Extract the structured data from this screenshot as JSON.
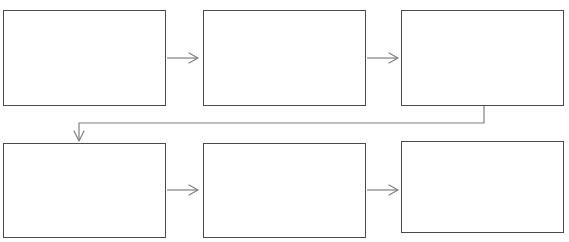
{
  "diagram": {
    "type": "flowchart",
    "title_cropped": "",
    "background_color": "#ffffff",
    "node_border_color": "#4a4a4a",
    "node_fill_color": "#ffffff",
    "connector_color": "#808080",
    "rows": 2,
    "columns": 3,
    "nodes": [
      {
        "id": "node-1",
        "label": "",
        "row": 1,
        "column": 1,
        "x": 3,
        "y": 10,
        "width": 163,
        "height": 96
      },
      {
        "id": "node-2",
        "label": "",
        "row": 1,
        "column": 2,
        "x": 203,
        "y": 10,
        "width": 163,
        "height": 96
      },
      {
        "id": "node-3",
        "label": "",
        "row": 1,
        "column": 3,
        "x": 401,
        "y": 10,
        "width": 163,
        "height": 96
      },
      {
        "id": "node-4",
        "label": "",
        "row": 2,
        "column": 1,
        "x": 3,
        "y": 143,
        "width": 163,
        "height": 95
      },
      {
        "id": "node-5",
        "label": "",
        "row": 2,
        "column": 2,
        "x": 203,
        "y": 143,
        "width": 163,
        "height": 95
      },
      {
        "id": "node-6",
        "label": "",
        "row": 2,
        "column": 3,
        "x": 401,
        "y": 141,
        "width": 163,
        "height": 92
      }
    ],
    "connectors": [
      {
        "id": "arrow-1-to-2",
        "from": "node-1",
        "to": "node-2",
        "label": "",
        "kind": "straight-right"
      },
      {
        "id": "arrow-2-to-3",
        "from": "node-2",
        "to": "node-3",
        "label": "",
        "kind": "straight-right"
      },
      {
        "id": "arrow-3-to-4",
        "from": "node-3",
        "to": "node-4",
        "label": "",
        "kind": "wrap-down-left"
      },
      {
        "id": "arrow-4-to-5",
        "from": "node-4",
        "to": "node-5",
        "label": "",
        "kind": "straight-right"
      },
      {
        "id": "arrow-5-to-6",
        "from": "node-5",
        "to": "node-6",
        "label": "",
        "kind": "straight-right"
      }
    ]
  }
}
